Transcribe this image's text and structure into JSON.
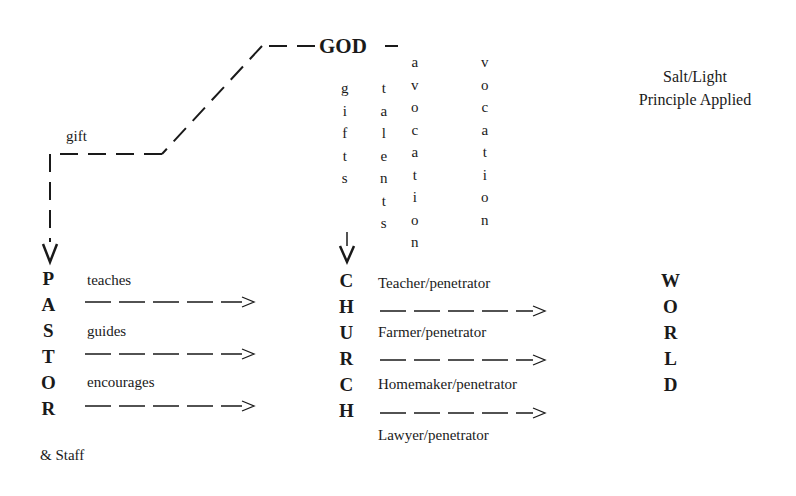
{
  "source": {
    "label": "GOD"
  },
  "legend": {
    "line1": "Salt/Light",
    "line2": "Principle Applied"
  },
  "gift_path": {
    "label": "gift"
  },
  "vertical_words": {
    "gifts": [
      "g",
      "i",
      "f",
      "t",
      "s"
    ],
    "talents": [
      "t",
      "a",
      "l",
      "e",
      "n",
      "t",
      "s"
    ],
    "avocation": [
      "a",
      "v",
      "o",
      "c",
      "a",
      "t",
      "i",
      "o",
      "n"
    ],
    "vocation": [
      "v",
      "o",
      "c",
      "a",
      "t",
      "i",
      "o",
      "n"
    ]
  },
  "pastor": {
    "letters": [
      "P",
      "A",
      "S",
      "T",
      "O",
      "R"
    ],
    "suffix": "& Staff",
    "actions": [
      "teaches",
      "guides",
      "encourages"
    ]
  },
  "church": {
    "letters": [
      "C",
      "H",
      "U",
      "R",
      "C",
      "H"
    ],
    "roles": [
      "Teacher/penetrator",
      "Farmer/penetrator",
      "Homemaker/penetrator",
      "Lawyer/penetrator"
    ]
  },
  "world": {
    "letters": [
      "W",
      "O",
      "R",
      "L",
      "D"
    ]
  },
  "colors": {
    "ink": "#1a1a1a",
    "background": "#ffffff"
  }
}
